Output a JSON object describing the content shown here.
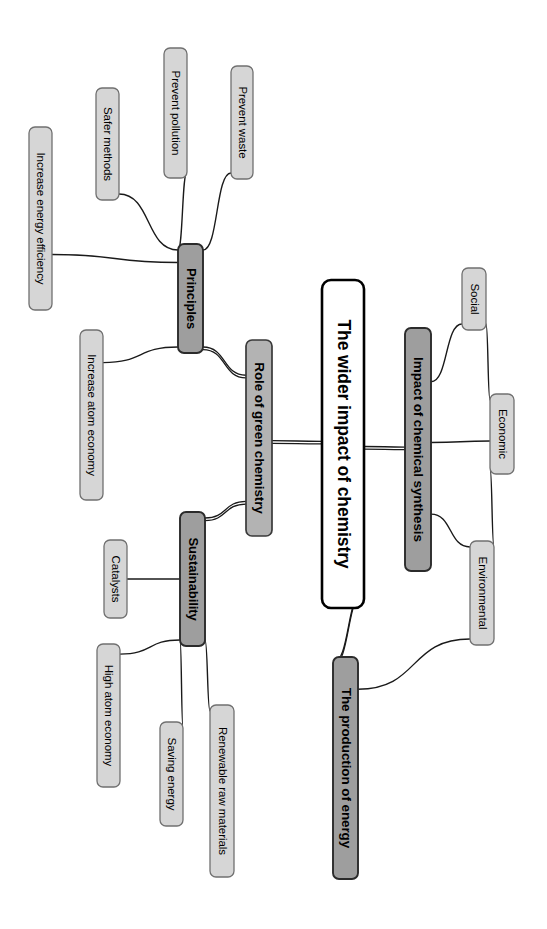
{
  "diagram": {
    "title": "The wider impact of chemistry",
    "type": "mind-map",
    "orientation": "rotated-90-clockwise",
    "background_color": "#ffffff",
    "palette": {
      "central_fill": "#ffffff",
      "central_stroke": "#000000",
      "branch_fill": "#9e9e9e",
      "branch_stroke": "#2b2b2b",
      "subbranch_fill": "#b3b3b3",
      "leaf_fill": "#d6d6d6",
      "leaf_stroke": "#707070",
      "edge_color": "#1a1a1a"
    }
  },
  "nodes": {
    "central": {
      "id": "central",
      "label": "The wider impact of chemistry",
      "level": 0,
      "style": "central",
      "x": 322,
      "y": 280,
      "w": 42,
      "h": 328
    },
    "branches": [
      {
        "id": "role-of-green-chemistry",
        "label": "Role of green chemistry",
        "level": 1,
        "style": "mid",
        "x": 246,
        "y": 340,
        "w": 26,
        "h": 196
      },
      {
        "id": "impact-of-chemical-synthesis",
        "label": "Impact of chemical synthesis",
        "level": 1,
        "style": "dark",
        "x": 405,
        "y": 328,
        "w": 26,
        "h": 243
      },
      {
        "id": "production-of-energy",
        "label": "The production of energy",
        "level": 1,
        "style": "dark",
        "x": 333,
        "y": 657,
        "w": 25,
        "h": 222
      }
    ],
    "subbranches": [
      {
        "id": "principles",
        "label": "Principles",
        "level": 2,
        "style": "dark",
        "parent": "role-of-green-chemistry",
        "x": 178,
        "y": 244,
        "w": 25,
        "h": 109
      },
      {
        "id": "sustainability",
        "label": "Sustainability",
        "level": 2,
        "style": "dark",
        "parent": "role-of-green-chemistry",
        "x": 180,
        "y": 512,
        "w": 25,
        "h": 134
      }
    ],
    "leaves": [
      {
        "id": "prevent-waste",
        "label": "Prevent waste",
        "parent": "principles",
        "x": 231,
        "y": 66,
        "w": 22,
        "h": 113
      },
      {
        "id": "prevent-pollution",
        "label": "Prevent pollution",
        "parent": "principles",
        "x": 164,
        "y": 48,
        "w": 23,
        "h": 130
      },
      {
        "id": "safer-methods",
        "label": "Safer methods",
        "parent": "principles",
        "x": 96,
        "y": 88,
        "w": 23,
        "h": 112
      },
      {
        "id": "increase-energy-efficiency",
        "label": "Increase energy efficiency",
        "parent": "principles",
        "x": 29,
        "y": 127,
        "w": 23,
        "h": 183
      },
      {
        "id": "increase-atom-economy",
        "label": "Increase atom economy",
        "parent": "principles",
        "x": 80,
        "y": 330,
        "w": 23,
        "h": 170
      },
      {
        "id": "catalysts",
        "label": "Catalysts",
        "parent": "sustainability",
        "x": 104,
        "y": 540,
        "w": 23,
        "h": 78
      },
      {
        "id": "high-atom-economy",
        "label": "High atom economy",
        "parent": "sustainability",
        "x": 97,
        "y": 644,
        "w": 23,
        "h": 143
      },
      {
        "id": "saving-energy",
        "label": "Saving energy",
        "parent": "sustainability",
        "x": 160,
        "y": 722,
        "w": 23,
        "h": 104
      },
      {
        "id": "renewable-raw-materials",
        "label": "Renewable raw materials",
        "parent": "sustainability",
        "x": 210,
        "y": 705,
        "w": 24,
        "h": 172
      },
      {
        "id": "social",
        "label": "Social",
        "parent": "impact-of-chemical-synthesis",
        "x": 462,
        "y": 268,
        "w": 24,
        "h": 62
      },
      {
        "id": "economic",
        "label": "Economic",
        "parent": "impact-of-chemical-synthesis",
        "x": 490,
        "y": 394,
        "w": 24,
        "h": 80
      },
      {
        "id": "environmental",
        "label": "Environmental",
        "parent": "impact-of-chemical-synthesis",
        "x": 470,
        "y": 541,
        "w": 24,
        "h": 104
      }
    ]
  },
  "edges": [
    {
      "from": "central",
      "to": "role-of-green-chemistry",
      "style": "thick"
    },
    {
      "from": "central",
      "to": "impact-of-chemical-synthesis",
      "style": "thick"
    },
    {
      "from": "central",
      "to": "production-of-energy",
      "style": "thick"
    },
    {
      "from": "role-of-green-chemistry",
      "to": "principles",
      "style": "thick"
    },
    {
      "from": "role-of-green-chemistry",
      "to": "sustainability",
      "style": "thick"
    },
    {
      "from": "principles",
      "to": "prevent-waste",
      "style": "thin"
    },
    {
      "from": "principles",
      "to": "prevent-pollution",
      "style": "thin"
    },
    {
      "from": "principles",
      "to": "safer-methods",
      "style": "thin"
    },
    {
      "from": "principles",
      "to": "increase-energy-efficiency",
      "style": "thin"
    },
    {
      "from": "principles",
      "to": "increase-atom-economy",
      "style": "thin"
    },
    {
      "from": "sustainability",
      "to": "catalysts",
      "style": "thin"
    },
    {
      "from": "sustainability",
      "to": "high-atom-economy",
      "style": "thin"
    },
    {
      "from": "sustainability",
      "to": "saving-energy",
      "style": "thin"
    },
    {
      "from": "sustainability",
      "to": "renewable-raw-materials",
      "style": "thin"
    },
    {
      "from": "impact-of-chemical-synthesis",
      "to": "social",
      "style": "thin"
    },
    {
      "from": "impact-of-chemical-synthesis",
      "to": "economic",
      "style": "thin"
    },
    {
      "from": "impact-of-chemical-synthesis",
      "to": "environmental",
      "style": "thin"
    },
    {
      "from": "social",
      "to": "economic",
      "style": "thin"
    },
    {
      "from": "economic",
      "to": "environmental",
      "style": "thin"
    },
    {
      "from": "environmental",
      "to": "production-of-energy",
      "style": "thin"
    }
  ]
}
